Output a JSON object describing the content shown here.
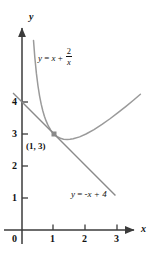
{
  "figure": {
    "background_color": "#ffffff",
    "axis_color": "#3b3b3b",
    "curve_color": "#9a9a9a",
    "line_color": "#8a8a8a",
    "marker_color": "#8a8a8a",
    "text_color": "#111111"
  },
  "axes": {
    "x_axis_label": "x",
    "y_axis_label": "y",
    "origin_label": "0",
    "x_ticks": [
      "1",
      "2",
      "3"
    ],
    "y_ticks": [
      "4",
      "3",
      "2",
      "1"
    ],
    "x_range": [
      -0.35,
      3.9
    ],
    "y_range": [
      -0.5,
      5.6
    ]
  },
  "annotations": {
    "point_label": "(1, 3)",
    "curve_label": {
      "lhs": "y",
      "equals": "=",
      "term1": "x",
      "plus": "+",
      "fraction_numerator": "2",
      "fraction_denominator": "x"
    },
    "line_label": {
      "text_lhs": "y",
      "equals": "=",
      "rhs": "-x + 4"
    }
  },
  "chart_data": {
    "type": "line",
    "title": "",
    "xlabel": "x",
    "ylabel": "y",
    "xlim": [
      -0.35,
      3.9
    ],
    "ylim": [
      -0.5,
      5.6
    ],
    "grid": false,
    "legend": "inline-annotations",
    "xticks": [
      1,
      2,
      3
    ],
    "yticks": [
      1,
      2,
      3,
      4
    ],
    "series": [
      {
        "name": "y = x + 2/x",
        "equation": "y = x + 2/x",
        "color": "#9a9a9a",
        "x": [
          0.36,
          0.4,
          0.45,
          0.5,
          0.55,
          0.6,
          0.65,
          0.7,
          0.75,
          0.8,
          0.85,
          0.9,
          0.95,
          1.0,
          1.1,
          1.2,
          1.3,
          1.414,
          1.5,
          1.6,
          1.8,
          2.0,
          2.25,
          2.5,
          2.75,
          3.0,
          3.25,
          3.5,
          3.7
        ],
        "y": [
          5.92,
          5.4,
          4.894,
          4.5,
          4.187,
          3.933,
          3.727,
          3.557,
          3.417,
          3.3,
          3.203,
          3.122,
          3.055,
          3.0,
          2.918,
          2.867,
          2.838,
          2.828,
          2.833,
          2.85,
          2.911,
          3.0,
          3.139,
          3.3,
          3.477,
          3.667,
          3.865,
          4.071,
          4.241
        ]
      },
      {
        "name": "y = -x + 4",
        "equation": "y = -x + 4",
        "color": "#8a8a8a",
        "x": [
          -0.28,
          2.92
        ],
        "y": [
          4.28,
          1.08
        ]
      }
    ],
    "points": [
      {
        "label": "(1, 3)",
        "x": 1,
        "y": 3,
        "marker": "square",
        "color": "#8a8a8a"
      }
    ]
  }
}
